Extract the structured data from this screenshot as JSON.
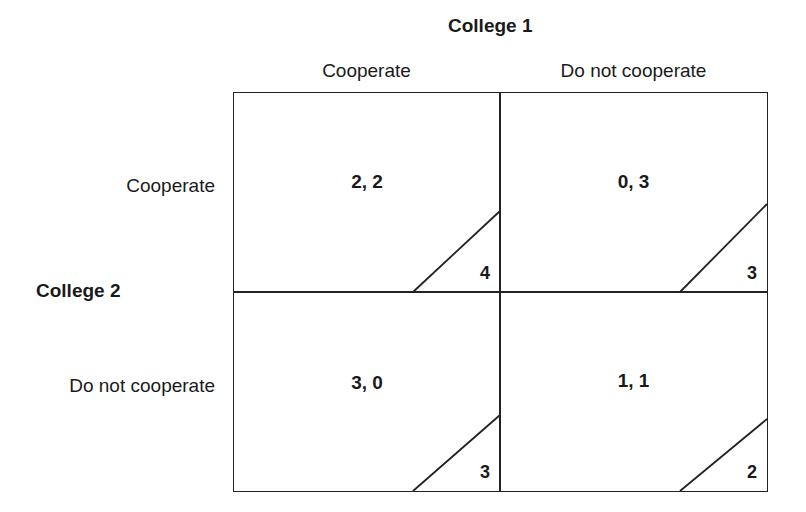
{
  "college1": {
    "label": "College 1",
    "strategies": [
      "Cooperate",
      "Do not cooperate"
    ]
  },
  "college2": {
    "label": "College 2",
    "strategies": [
      "Cooperate",
      "Do not cooperate"
    ]
  },
  "cells": [
    {
      "row": "Cooperate",
      "col": "Cooperate",
      "payoff": "2, 2",
      "total": "4"
    },
    {
      "row": "Cooperate",
      "col": "Do not cooperate",
      "payoff": "0, 3",
      "total": "3"
    },
    {
      "row": "Do not cooperate",
      "col": "Cooperate",
      "payoff": "3, 0",
      "total": "3"
    },
    {
      "row": "Do not cooperate",
      "col": "Do not cooperate",
      "payoff": "1, 1",
      "total": "2"
    }
  ],
  "colors": {
    "line": "#222222",
    "text": "#1a1a1a",
    "background": "#ffffff"
  }
}
